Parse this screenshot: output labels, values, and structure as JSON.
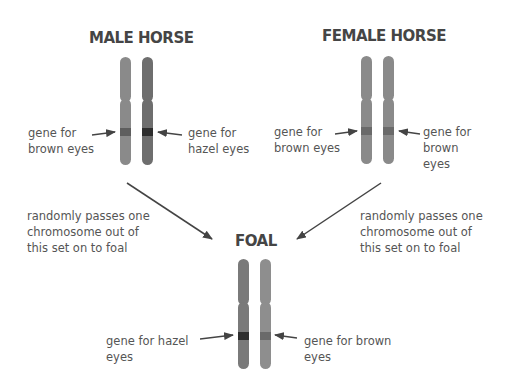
{
  "male": {
    "title": "MALE HORSE",
    "left_label_line1": "gene for",
    "left_label_line2": "brown eyes",
    "right_label_line1": "gene for",
    "right_label_line2": "hazel eyes"
  },
  "female": {
    "title": "FEMALE HORSE",
    "left_label_line1": "gene for",
    "left_label_line2": "brown eyes",
    "right_label_line1": "gene for",
    "right_label_line2": "brown",
    "right_label_line3": "eyes"
  },
  "foal": {
    "title": "FOAL",
    "left_label_line1": "gene for hazel",
    "left_label_line2": "eyes",
    "right_label_line1": "gene for brown",
    "right_label_line2": "eyes"
  },
  "pass_note_left": {
    "line1": "randomly passes one",
    "line2": "chromosome out of",
    "line3": "this set on to foal"
  },
  "pass_note_right": {
    "line1": "randomly passes one",
    "line2": "chromosome out of",
    "line3": "this set on to foal"
  },
  "colors": {
    "chromosome_light": "#8a8a8a",
    "chromosome_dark": "#6e6e6e",
    "band_brown": "#5e5e5e",
    "band_hazel": "#2e2e2e",
    "arrow": "#444444",
    "title": "#454545",
    "text": "#555555"
  }
}
